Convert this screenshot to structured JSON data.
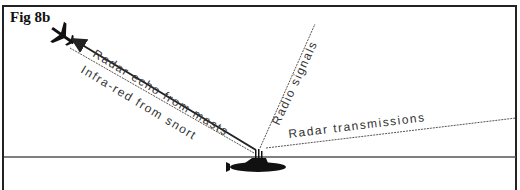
{
  "figure": {
    "label": "Fig 8b",
    "labels": {
      "radar_echo": "Radar echo from masts",
      "infra_red": "Infra-red from snort",
      "radio": "Radio signals",
      "radar_tx": "Radar transmissions"
    },
    "elements": [
      "aircraft",
      "submarine",
      "sea-surface"
    ],
    "colors": {
      "ink": "#222222",
      "wave": "#555555",
      "background": "#ffffff"
    }
  }
}
